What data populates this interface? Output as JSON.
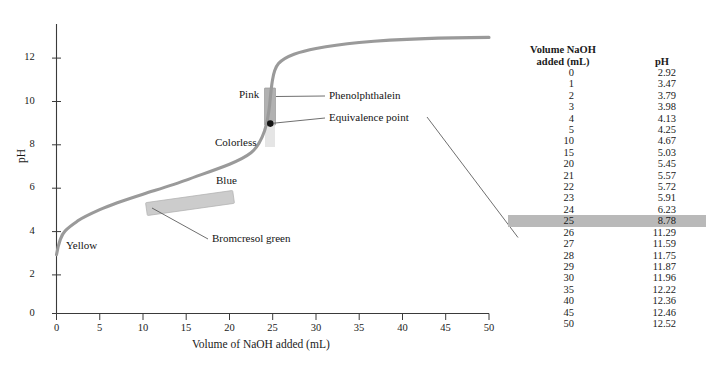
{
  "chart_data": {
    "type": "line",
    "title": "",
    "xlabel": "Volume of NaOH added  (mL)",
    "ylabel": "pH",
    "xlim": [
      0,
      50
    ],
    "ylim": [
      0,
      13.2
    ],
    "xticks": [
      0,
      5,
      10,
      15,
      20,
      25,
      30,
      35,
      40,
      45,
      50
    ],
    "yticks": [
      0,
      2,
      4,
      6,
      8,
      10,
      12
    ],
    "grid": false,
    "legend": "none",
    "series": [
      {
        "name": "Titration of weak acid with NaOH",
        "x": [
          0,
          1,
          2,
          3,
          4,
          5,
          10,
          15,
          20,
          21,
          22,
          23,
          24,
          25,
          26,
          27,
          28,
          29,
          30,
          35,
          40,
          45,
          50
        ],
        "values": [
          2.92,
          3.47,
          3.79,
          3.98,
          4.13,
          4.25,
          4.67,
          5.03,
          5.45,
          5.57,
          5.72,
          5.91,
          6.23,
          8.78,
          11.29,
          11.59,
          11.75,
          11.87,
          11.96,
          12.22,
          12.36,
          12.46,
          12.52
        ]
      }
    ],
    "annotations": [
      {
        "label": "Pink",
        "x": 21.0,
        "y": 9.8
      },
      {
        "label": "Colorless",
        "x": 19.5,
        "y": 7.1
      },
      {
        "label": "Blue",
        "x": 18.5,
        "y": 6.2
      },
      {
        "label": "Yellow",
        "x": 3.5,
        "y": 3.3
      },
      {
        "label": "Phenolphthalein",
        "x": 30.5,
        "y": 9.9
      },
      {
        "label": "Equivalence point",
        "x": 30.5,
        "y": 9.0
      },
      {
        "label": "Bromcresol green",
        "x": 24.0,
        "y": 3.45
      }
    ],
    "indicator_bands": [
      {
        "name": "phenolphthalein",
        "ph_low": 8.2,
        "ph_high": 10.0,
        "color": "#b0b0b0"
      },
      {
        "name": "bromcresol-green",
        "ph_low": 3.8,
        "ph_high": 5.4,
        "color": "#c4c4c4"
      }
    ],
    "equivalence_point": {
      "volume_mL": 25,
      "pH": 8.78
    }
  },
  "chart": {
    "ylabel": "pH",
    "xlabel": "Volume of NaOH added  (mL)",
    "xticks": [
      "0",
      "5",
      "10",
      "15",
      "20",
      "25",
      "30",
      "35",
      "40",
      "45",
      "50"
    ],
    "yticks": [
      "0",
      "2",
      "4",
      "6",
      "8",
      "10",
      "12"
    ],
    "annotations": {
      "pink": "Pink",
      "colorless": "Colorless",
      "blue": "Blue",
      "yellow": "Yellow",
      "phenolphthalein": "Phenolphthalein",
      "equivalence_point": "Equivalence point",
      "bromcresol_green": "Bromcresol green"
    },
    "colors": {
      "curve": "#9a9a9a",
      "axis": "#3a3a3a",
      "leader": "#5a5a5a",
      "band": "#b5b5b5",
      "highlight": "#b9b9b9"
    }
  },
  "table": {
    "header_volume_line1": "Volume NaOH",
    "header_volume_line2": "added (mL)",
    "header_ph": "pH",
    "highlighted_row_index": 13,
    "rows": [
      {
        "volume": "0",
        "ph": "2.92"
      },
      {
        "volume": "1",
        "ph": "3.47"
      },
      {
        "volume": "2",
        "ph": "3.79"
      },
      {
        "volume": "3",
        "ph": "3.98"
      },
      {
        "volume": "4",
        "ph": "4.13"
      },
      {
        "volume": "5",
        "ph": "4.25"
      },
      {
        "volume": "10",
        "ph": "4.67"
      },
      {
        "volume": "15",
        "ph": "5.03"
      },
      {
        "volume": "20",
        "ph": "5.45"
      },
      {
        "volume": "21",
        "ph": "5.57"
      },
      {
        "volume": "22",
        "ph": "5.72"
      },
      {
        "volume": "23",
        "ph": "5.91"
      },
      {
        "volume": "24",
        "ph": "6.23"
      },
      {
        "volume": "25",
        "ph": "8.78"
      },
      {
        "volume": "26",
        "ph": "11.29"
      },
      {
        "volume": "27",
        "ph": "11.59"
      },
      {
        "volume": "28",
        "ph": "11.75"
      },
      {
        "volume": "29",
        "ph": "11.87"
      },
      {
        "volume": "30",
        "ph": "11.96"
      },
      {
        "volume": "35",
        "ph": "12.22"
      },
      {
        "volume": "40",
        "ph": "12.36"
      },
      {
        "volume": "45",
        "ph": "12.46"
      },
      {
        "volume": "50",
        "ph": "12.52"
      }
    ]
  }
}
